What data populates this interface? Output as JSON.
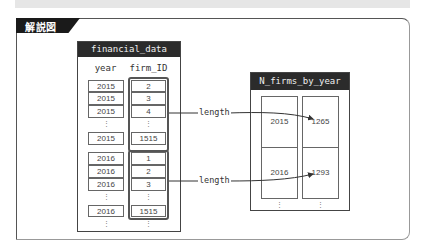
{
  "header": {
    "tab_label": "解説図"
  },
  "financial_data": {
    "title": "financial_data",
    "columns": [
      "year",
      "firm_ID"
    ],
    "groups": [
      {
        "rows": [
          [
            "2015",
            "2"
          ],
          [
            "2015",
            "3"
          ],
          [
            "2015",
            "4"
          ]
        ],
        "ellipsis": "⋮",
        "last": [
          "2015",
          "1515"
        ]
      },
      {
        "rows": [
          [
            "2016",
            "1"
          ],
          [
            "2016",
            "2"
          ],
          [
            "2016",
            "3"
          ]
        ],
        "ellipsis": "⋮",
        "last": [
          "2016",
          "1515"
        ]
      }
    ],
    "trailing_ellipsis": "⋮"
  },
  "arrows": [
    {
      "label": "length"
    },
    {
      "label": "length"
    }
  ],
  "n_firms_by_year": {
    "title": "N_firms_by_year",
    "rows": [
      [
        "2015",
        "1265"
      ],
      [
        "2016",
        "1293"
      ]
    ],
    "trailing_ellipsis": "⋮"
  },
  "colors": {
    "header_bg": "#2b2b2b",
    "tab_bg": "#1a1a1a",
    "border": "#555555"
  }
}
